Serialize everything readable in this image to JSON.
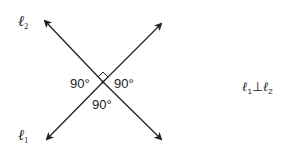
{
  "diagram": {
    "lines": [
      {
        "name": "l1",
        "label": "ℓ",
        "subscript": "1",
        "from": [
          46,
          140
        ],
        "to": [
          162,
          23
        ]
      },
      {
        "name": "l2",
        "label": "ℓ",
        "subscript": "2",
        "from": [
          44,
          20
        ],
        "to": [
          162,
          140
        ]
      }
    ],
    "intersection": [
      103,
      82
    ],
    "angles": {
      "left": "90°",
      "right": "90°",
      "bottom": "90°"
    },
    "statement": {
      "left": "ℓ",
      "left_sub": "1",
      "symbol": "⊥",
      "right": "ℓ",
      "right_sub": "2"
    },
    "colors": {
      "line": "#222222",
      "background": "#ffffff"
    }
  }
}
